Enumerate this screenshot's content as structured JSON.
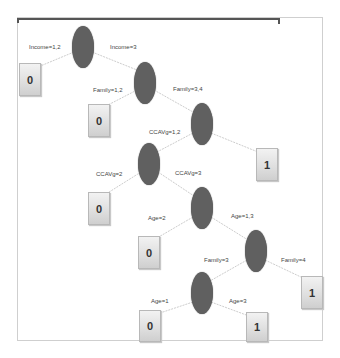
{
  "diagram": {
    "type": "decision-tree",
    "nodes": [
      {
        "id": "n1",
        "kind": "split"
      },
      {
        "id": "n2",
        "kind": "split"
      },
      {
        "id": "n3",
        "kind": "split"
      },
      {
        "id": "n4",
        "kind": "split"
      },
      {
        "id": "n5",
        "kind": "split"
      },
      {
        "id": "n6",
        "kind": "split"
      },
      {
        "id": "n7",
        "kind": "split"
      }
    ],
    "leaves": [
      {
        "id": "l1",
        "value": "0"
      },
      {
        "id": "l2",
        "value": "0"
      },
      {
        "id": "l3",
        "value": "1"
      },
      {
        "id": "l4",
        "value": "0"
      },
      {
        "id": "l5",
        "value": "0"
      },
      {
        "id": "l6",
        "value": "1"
      },
      {
        "id": "l7",
        "value": "0"
      },
      {
        "id": "l8",
        "value": "1"
      }
    ],
    "edges": [
      {
        "from": "n1",
        "to": "l1",
        "label": "Income=1,2"
      },
      {
        "from": "n1",
        "to": "n2",
        "label": "Income=3"
      },
      {
        "from": "n2",
        "to": "l2",
        "label": "Family=1,2"
      },
      {
        "from": "n2",
        "to": "n3",
        "label": "Family=3,4"
      },
      {
        "from": "n3",
        "to": "n4",
        "label": "CCAVg=1,2"
      },
      {
        "from": "n3",
        "to": "l3",
        "label": ""
      },
      {
        "from": "n4",
        "to": "l4",
        "label": "CCAVg=2"
      },
      {
        "from": "n4",
        "to": "n5",
        "label": "CCAVg=3"
      },
      {
        "from": "n5",
        "to": "l5",
        "label": "Age=2"
      },
      {
        "from": "n5",
        "to": "n6",
        "label": "Age=1,3"
      },
      {
        "from": "n6",
        "to": "n7",
        "label": "Family=3"
      },
      {
        "from": "n6",
        "to": "l6",
        "label": "Family=4"
      },
      {
        "from": "n7",
        "to": "l7",
        "label": "Age=1"
      },
      {
        "from": "n7",
        "to": "l8",
        "label": "Age=3"
      }
    ],
    "colors": {
      "split_node": "#606060",
      "edge": "#c8c8c8",
      "frame": "#cfcfcf",
      "top_bar": "#555555"
    }
  }
}
